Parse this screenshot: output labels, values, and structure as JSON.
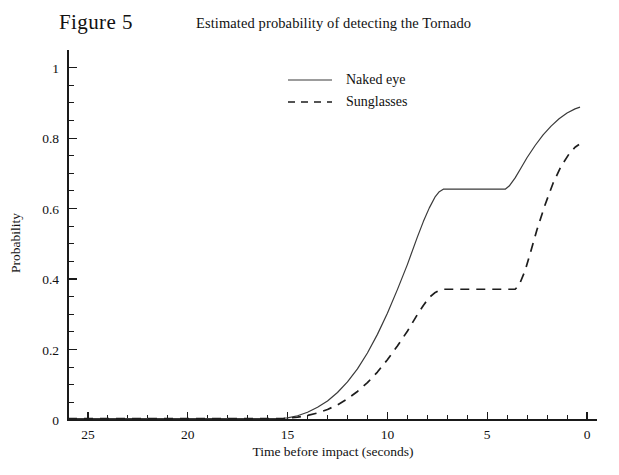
{
  "figure": {
    "number_label": "Figure 5",
    "title": "Estimated probability of detecting the Tornado"
  },
  "chart_data": {
    "type": "line",
    "title": "Estimated probability of detecting the Tornado",
    "xlabel": "Time before impact  (seconds)",
    "ylabel": "Probability",
    "xlim": [
      26,
      -0.5
    ],
    "ylim": [
      0,
      1.05
    ],
    "x_reversed": true,
    "grid": false,
    "legend_position": "top-center",
    "xticks": [
      25,
      20,
      15,
      10,
      5,
      0
    ],
    "xtick_labels": [
      "25",
      "20",
      "15",
      "10",
      "5",
      "0"
    ],
    "x_minor_step": 1,
    "yticks": [
      0,
      0.2,
      0.4,
      0.6,
      0.8,
      1
    ],
    "ytick_labels": [
      "0",
      "0.2",
      "0.4",
      "0.6",
      "0.8",
      "1"
    ],
    "y_minor_step": 0.05,
    "series": [
      {
        "name": "Naked eye",
        "style": "solid",
        "x": [
          26.0,
          25.0,
          22.0,
          20.0,
          18.0,
          16.0,
          15.2,
          15.0,
          14.5,
          14.0,
          13.5,
          13.0,
          12.5,
          12.0,
          11.5,
          11.0,
          10.5,
          10.0,
          9.5,
          9.0,
          8.5,
          8.2,
          7.9,
          7.6,
          7.4,
          7.2,
          4.1,
          3.9,
          3.6,
          3.3,
          3.0,
          2.6,
          2.2,
          1.8,
          1.4,
          1.0,
          0.6,
          0.35
        ],
        "y": [
          0.004,
          0.004,
          0.004,
          0.004,
          0.004,
          0.004,
          0.005,
          0.006,
          0.012,
          0.022,
          0.036,
          0.054,
          0.078,
          0.108,
          0.145,
          0.19,
          0.243,
          0.303,
          0.37,
          0.441,
          0.519,
          0.563,
          0.602,
          0.634,
          0.648,
          0.655,
          0.655,
          0.664,
          0.687,
          0.716,
          0.745,
          0.779,
          0.809,
          0.834,
          0.855,
          0.871,
          0.883,
          0.888
        ]
      },
      {
        "name": "Sunglasses",
        "style": "dashed",
        "x": [
          26.0,
          25.0,
          22.0,
          20.0,
          18.0,
          16.0,
          15.2,
          15.0,
          14.5,
          14.0,
          13.5,
          13.0,
          12.5,
          12.0,
          11.5,
          11.0,
          10.5,
          10.0,
          9.5,
          9.0,
          8.5,
          8.2,
          7.9,
          7.6,
          7.4,
          7.2,
          3.6,
          3.4,
          3.1,
          2.8,
          2.5,
          2.1,
          1.7,
          1.3,
          0.9,
          0.6,
          0.4
        ],
        "y": [
          0.004,
          0.004,
          0.004,
          0.004,
          0.004,
          0.004,
          0.004,
          0.005,
          0.008,
          0.013,
          0.02,
          0.03,
          0.043,
          0.06,
          0.081,
          0.106,
          0.136,
          0.171,
          0.21,
          0.252,
          0.299,
          0.325,
          0.348,
          0.362,
          0.368,
          0.371,
          0.371,
          0.383,
          0.424,
          0.482,
          0.541,
          0.611,
          0.672,
          0.72,
          0.755,
          0.774,
          0.782
        ]
      }
    ],
    "annotations": []
  },
  "legend": {
    "entries": [
      {
        "label": "Naked eye",
        "style": "solid"
      },
      {
        "label": "Sunglasses",
        "style": "dashed"
      }
    ]
  },
  "colors": {
    "axis": "#1a1a1a",
    "solid_series": "#3a3a3a",
    "dashed_series": "#1d1d1d",
    "background": "#ffffff",
    "text": "#111111"
  }
}
